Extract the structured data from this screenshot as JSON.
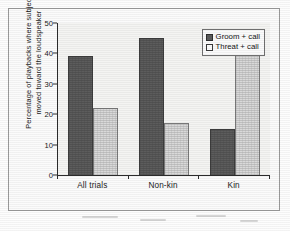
{
  "chart_data": {
    "type": "bar",
    "title": "",
    "xlabel": "",
    "ylabel": "Percentage of playbacks where subject\nmoved toward the loudspeaker",
    "categories": [
      "All trials",
      "Non-kin",
      "Kin"
    ],
    "series": [
      {
        "name": "Groom + call",
        "values": [
          39,
          45,
          15
        ],
        "color": "#5c5c5c"
      },
      {
        "name": "Threat + call",
        "values": [
          22,
          17,
          40
        ],
        "color": "#d9d9d9"
      }
    ],
    "ylim": [
      0,
      50
    ],
    "yticks": [
      0,
      10,
      20,
      30,
      40,
      50
    ],
    "ytick_labels": [
      "0",
      "10",
      "20",
      "30",
      "40",
      "50"
    ],
    "grid": false,
    "legend_position": "top-right"
  },
  "legend": {
    "items": [
      {
        "label": "Groom + call",
        "swatch": "dark"
      },
      {
        "label": "Threat + call",
        "swatch": "light"
      }
    ]
  }
}
